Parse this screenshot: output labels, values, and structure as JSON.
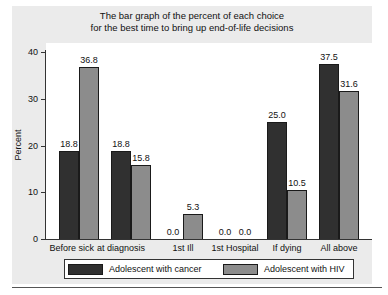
{
  "chart_data": {
    "type": "bar",
    "title": "The bar graph of the percent of each choice for the best time to bring up end-of-life decisions",
    "title_lines": [
      "The bar graph of the percent of each choice",
      "for the best time to bring up end-of-life decisions"
    ],
    "xlabel": "",
    "ylabel": "Percent",
    "ylim": [
      0,
      40
    ],
    "yticks": [
      0,
      10,
      20,
      30,
      40
    ],
    "grid": false,
    "legend_position": "bottom",
    "categories": [
      "Before sick",
      "at diagnosis",
      "1st Ill",
      "1st Hospital",
      "If dying",
      "All above"
    ],
    "series": [
      {
        "name": "Adolescent with cancer",
        "color": "#303030",
        "values": [
          18.8,
          18.8,
          0.0,
          0.0,
          25.0,
          37.5
        ]
      },
      {
        "name": "Adolescent with HIV",
        "color": "#8c8c8c",
        "values": [
          36.8,
          15.8,
          5.3,
          0.0,
          10.5,
          31.6
        ]
      }
    ],
    "value_labels": [
      [
        "18.8",
        "18.8",
        "0.0",
        "0.0",
        "25.0",
        "37.5"
      ],
      [
        "36.8",
        "15.8",
        "5.3",
        "0.0",
        "10.5",
        "31.6"
      ]
    ]
  },
  "tick_labels": [
    "0",
    "10",
    "20",
    "30",
    "40"
  ]
}
